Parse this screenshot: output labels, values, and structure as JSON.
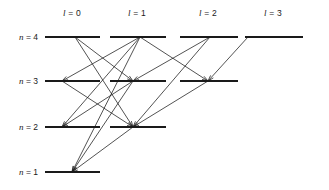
{
  "figure": {
    "type": "energy-level-diagram",
    "title": "",
    "background": "#ffffff",
    "line_color": "#1a1a1a",
    "text_color": "#1a1a1a",
    "width": 329,
    "height": 190
  },
  "columns": [
    {
      "id": "l0",
      "symbol": "l",
      "equals": "=",
      "value": "0",
      "label": "l = 0",
      "center_x": 72,
      "label_y": 14,
      "x1": 45,
      "x2": 100
    },
    {
      "id": "l1",
      "symbol": "l",
      "equals": "=",
      "value": "1",
      "label": "l = 1",
      "center_x": 137,
      "label_y": 14,
      "x1": 110,
      "x2": 166
    },
    {
      "id": "l2",
      "symbol": "l",
      "equals": "=",
      "value": "2",
      "label": "l = 2",
      "center_x": 208,
      "label_y": 14,
      "x1": 180,
      "x2": 238
    },
    {
      "id": "l3",
      "symbol": "l",
      "equals": "=",
      "value": "3",
      "label": "l = 3",
      "center_x": 273,
      "label_y": 14,
      "x1": 245,
      "x2": 303
    }
  ],
  "rows": [
    {
      "id": "n4",
      "symbol": "n",
      "equals": "=",
      "value": "4",
      "label": "n = 4",
      "y": 37,
      "label_x": 38,
      "levels": [
        "l0",
        "l1",
        "l2",
        "l3"
      ]
    },
    {
      "id": "n3",
      "symbol": "n",
      "equals": "=",
      "value": "3",
      "label": "n = 3",
      "y": 81,
      "label_x": 38,
      "levels": [
        "l0",
        "l1",
        "l2"
      ]
    },
    {
      "id": "n2",
      "symbol": "n",
      "equals": "=",
      "value": "2",
      "label": "n = 2",
      "y": 127,
      "label_x": 38,
      "levels": [
        "l0",
        "l1"
      ]
    },
    {
      "id": "n1",
      "symbol": "n",
      "equals": "=",
      "value": "1",
      "label": "n = 1",
      "y": 172,
      "label_x": 38,
      "levels": [
        "l0"
      ]
    }
  ],
  "chart_data": {
    "type": "diagram",
    "level_rows": [
      "n = 4",
      "n = 3",
      "n = 2",
      "n = 1"
    ],
    "level_columns": [
      "l = 0",
      "l = 1",
      "l = 2",
      "l = 3"
    ],
    "levels": [
      {
        "n": 4,
        "l": 0,
        "x": 75,
        "y": 37
      },
      {
        "n": 4,
        "l": 1,
        "x": 140,
        "y": 37
      },
      {
        "n": 4,
        "l": 2,
        "x": 210,
        "y": 37
      },
      {
        "n": 4,
        "l": 3,
        "x": 248,
        "y": 37
      },
      {
        "n": 3,
        "l": 0,
        "x": 62,
        "y": 81
      },
      {
        "n": 3,
        "l": 1,
        "x": 133,
        "y": 81
      },
      {
        "n": 3,
        "l": 2,
        "x": 208,
        "y": 81
      },
      {
        "n": 2,
        "l": 0,
        "x": 62,
        "y": 127
      },
      {
        "n": 2,
        "l": 1,
        "x": 133,
        "y": 127
      },
      {
        "n": 1,
        "l": 0,
        "x": 72,
        "y": 172
      }
    ],
    "transitions": [
      {
        "from": [
          75,
          37
        ],
        "to": [
          133,
          81
        ]
      },
      {
        "from": [
          75,
          37
        ],
        "to": [
          133,
          127
        ]
      },
      {
        "from": [
          140,
          37
        ],
        "to": [
          62,
          81
        ]
      },
      {
        "from": [
          140,
          37
        ],
        "to": [
          62,
          127
        ]
      },
      {
        "from": [
          140,
          37
        ],
        "to": [
          72,
          172
        ]
      },
      {
        "from": [
          140,
          37
        ],
        "to": [
          208,
          81
        ]
      },
      {
        "from": [
          210,
          37
        ],
        "to": [
          133,
          81
        ]
      },
      {
        "from": [
          210,
          37
        ],
        "to": [
          133,
          127
        ]
      },
      {
        "from": [
          248,
          37
        ],
        "to": [
          208,
          81
        ]
      },
      {
        "from": [
          62,
          81
        ],
        "to": [
          133,
          127
        ]
      },
      {
        "from": [
          133,
          81
        ],
        "to": [
          62,
          127
        ]
      },
      {
        "from": [
          133,
          81
        ],
        "to": [
          72,
          172
        ]
      },
      {
        "from": [
          208,
          81
        ],
        "to": [
          133,
          127
        ]
      },
      {
        "from": [
          133,
          127
        ],
        "to": [
          72,
          172
        ]
      }
    ],
    "arrow_style": "open-v-head",
    "grid": false,
    "legend": "none"
  }
}
